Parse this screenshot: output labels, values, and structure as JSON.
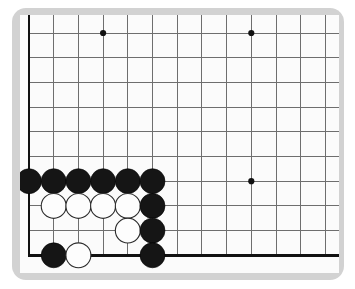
{
  "app": {
    "title": "Go Board Diagram",
    "view": "bottom-left corner, cropped board"
  },
  "board": {
    "frame_color": "#d2d2d2",
    "surface_color": "#fbfbfb",
    "line_color": "#6e6e6e",
    "edge_color": "#111111",
    "black_stone_color": "#151515",
    "white_stone_color": "#fdfdfd",
    "grid_spacing_px": 24.7,
    "origin_x_px": 29,
    "origin_y_px": 33,
    "columns_visible": 13,
    "rows_visible": 10,
    "left_edge_is_board_edge": true,
    "bottom_edge_is_board_edge": true,
    "right_edge_is_board_edge": false,
    "top_edge_is_board_edge": false
  },
  "star_points": [
    {
      "col": 3,
      "row": 0
    },
    {
      "col": 9,
      "row": 0
    },
    {
      "col": 9,
      "row": 6
    }
  ],
  "stones": [
    {
      "color": "black",
      "col": 0,
      "row": 6
    },
    {
      "color": "black",
      "col": 1,
      "row": 6
    },
    {
      "color": "black",
      "col": 2,
      "row": 6
    },
    {
      "color": "black",
      "col": 3,
      "row": 6
    },
    {
      "color": "black",
      "col": 4,
      "row": 6
    },
    {
      "color": "black",
      "col": 5,
      "row": 6
    },
    {
      "color": "white",
      "col": 1,
      "row": 7
    },
    {
      "color": "white",
      "col": 2,
      "row": 7
    },
    {
      "color": "white",
      "col": 3,
      "row": 7
    },
    {
      "color": "white",
      "col": 4,
      "row": 7
    },
    {
      "color": "black",
      "col": 5,
      "row": 7
    },
    {
      "color": "white",
      "col": 4,
      "row": 8
    },
    {
      "color": "black",
      "col": 5,
      "row": 8
    },
    {
      "color": "black",
      "col": 1,
      "row": 9
    },
    {
      "color": "white",
      "col": 2,
      "row": 9
    },
    {
      "color": "black",
      "col": 5,
      "row": 9
    }
  ],
  "counts": {
    "black_stones": 11,
    "white_stones": 6,
    "total_stones": 17
  }
}
